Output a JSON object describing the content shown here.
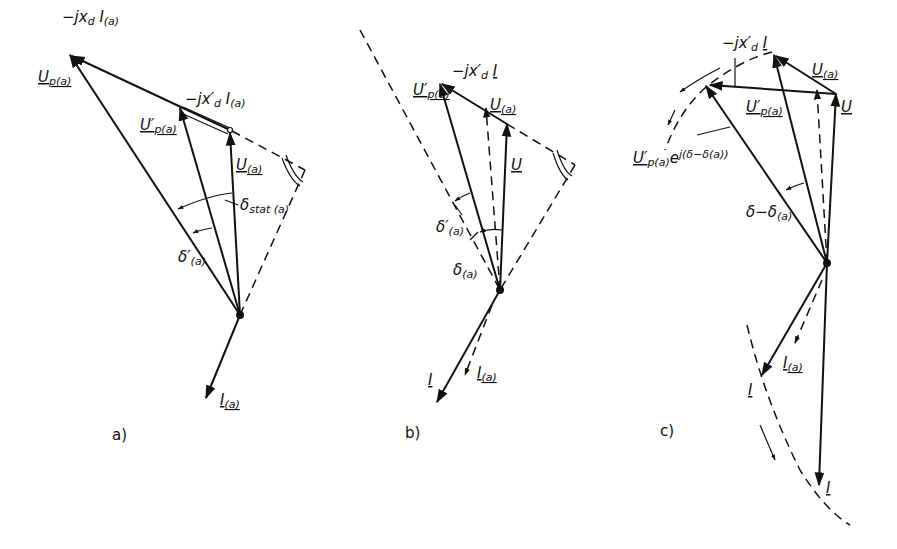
{
  "figure": {
    "panels": [
      {
        "caption": "a)",
        "labels": {
          "jxd_I": "−jx",
          "jxd_I_sub": "d",
          "jxd_I_tail": "I",
          "jxd_I_tail_sub": "(a)",
          "Up": "U",
          "Up_sub": "p(a)",
          "jxd_prime_I": "−jx′",
          "jxd_prime_I_sub": "d",
          "jxd_prime_I_tail": "I",
          "jxd_prime_I_tail_sub": "(a)",
          "Up_prime": "U′",
          "Up_prime_sub": "p(a)",
          "U": "U",
          "U_sub": "(a)",
          "delta_stat": "δ",
          "delta_stat_sub": "stat (a)",
          "delta_prime": "δ′",
          "delta_prime_sub": "(a)",
          "I": "I",
          "I_sub": "(a)"
        }
      },
      {
        "caption": "b)",
        "labels": {
          "Up_prime": "U′",
          "Up_prime_sub": "p(a)",
          "jxd_prime_I": "−jx′",
          "jxd_prime_I_sub": "d",
          "jxd_prime_I_tail": "I",
          "U_a": "U",
          "U_a_sub": "(a)",
          "U": "U",
          "delta_prime": "δ′",
          "delta_prime_sub": "(a)",
          "delta": "δ",
          "delta_sub": "(a)",
          "I": "I",
          "I_a": "I",
          "I_a_sub": "(a)"
        }
      },
      {
        "caption": "c)",
        "labels": {
          "jxd_prime_I": "−jx′",
          "jxd_prime_I_sub": "d",
          "jxd_prime_I_tail": "I",
          "U_a": "U",
          "U_a_sub": "(a)",
          "U": "U",
          "Up_prime": "U′",
          "Up_prime_sub": "p(a)",
          "Up_rot": "U′",
          "Up_rot_sub": "p(a)",
          "Up_rot_exp": "e",
          "Up_rot_exp_sup": "j(δ−δ(a))",
          "delta_diff": "δ−δ",
          "delta_diff_sub": "(a)",
          "I_a": "I",
          "I_a_sub": "(a)",
          "I_mid": "I",
          "I_bottom": "I"
        }
      }
    ]
  }
}
